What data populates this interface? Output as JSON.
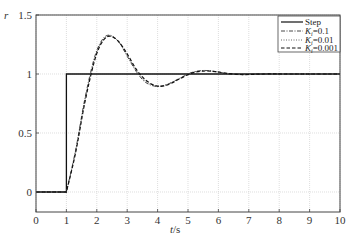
{
  "chart_data": {
    "type": "line",
    "title": "",
    "xlabel": "t/s",
    "ylabel": "r",
    "xlim": [
      0,
      10
    ],
    "ylim": [
      -0.17,
      1.5
    ],
    "xticks": [
      "0",
      "1",
      "2",
      "3",
      "4",
      "5",
      "6",
      "7",
      "8",
      "9",
      "10"
    ],
    "yticks": [
      "0",
      "0.5",
      "1",
      "1.5"
    ],
    "grid": true,
    "legend_position": "upper right",
    "legend": [
      "Step",
      "Ki=0.1",
      "Ki=0.01",
      "Ki=0.001"
    ],
    "series": [
      {
        "name": "Step",
        "style": "solid",
        "x": [
          0,
          1,
          1,
          10
        ],
        "y": [
          0,
          0,
          1,
          1
        ]
      },
      {
        "name": "Ki=0.1",
        "style": "dash-dot",
        "x": [
          0,
          1,
          1.3,
          1.6,
          1.9,
          2.15,
          2.4,
          2.7,
          3.0,
          3.3,
          3.6,
          3.95,
          4.3,
          4.7,
          5.1,
          5.5,
          5.9,
          6.3,
          6.8,
          7.5,
          8.5,
          10
        ],
        "y": [
          0,
          0,
          0.35,
          0.78,
          1.12,
          1.28,
          1.33,
          1.28,
          1.15,
          1.02,
          0.93,
          0.895,
          0.91,
          0.96,
          1.01,
          1.03,
          1.02,
          1.0,
          0.995,
          1.0,
          1.0,
          1.0
        ]
      },
      {
        "name": "Ki=0.01",
        "style": "dotted",
        "x": [
          0,
          1,
          1.3,
          1.6,
          1.9,
          2.15,
          2.4,
          2.7,
          3.0,
          3.3,
          3.6,
          3.95,
          4.3,
          4.7,
          5.1,
          5.5,
          5.9,
          6.3,
          6.8,
          7.5,
          8.5,
          10
        ],
        "y": [
          0,
          0,
          0.34,
          0.76,
          1.1,
          1.27,
          1.32,
          1.28,
          1.16,
          1.03,
          0.94,
          0.9,
          0.91,
          0.96,
          1.01,
          1.03,
          1.02,
          1.005,
          0.995,
          1.0,
          1.0,
          1.0
        ]
      },
      {
        "name": "Ki=0.001",
        "style": "dashed",
        "x": [
          0,
          1,
          1.3,
          1.6,
          1.9,
          2.15,
          2.4,
          2.7,
          3.0,
          3.3,
          3.6,
          3.95,
          4.3,
          4.7,
          5.1,
          5.5,
          5.9,
          6.3,
          6.8,
          7.5,
          8.5,
          10
        ],
        "y": [
          0,
          0,
          0.33,
          0.75,
          1.09,
          1.26,
          1.32,
          1.28,
          1.17,
          1.04,
          0.95,
          0.9,
          0.905,
          0.955,
          1.005,
          1.025,
          1.02,
          1.005,
          0.995,
          1.0,
          1.0,
          1.0
        ]
      }
    ]
  },
  "axes": {
    "xlabel_t": "t",
    "xlabel_unit": "/s",
    "ylabel": "r"
  },
  "legend": {
    "items": [
      {
        "label": "Step",
        "style": "solid"
      },
      {
        "label_main": "K",
        "label_sub": "i",
        "label_rest": "=0.1",
        "style": "dash-dot"
      },
      {
        "label_main": "K",
        "label_sub": "i",
        "label_rest": "=0.01",
        "style": "dotted"
      },
      {
        "label_main": "K",
        "label_sub": "i",
        "label_rest": "=0.001",
        "style": "dashed"
      }
    ]
  }
}
